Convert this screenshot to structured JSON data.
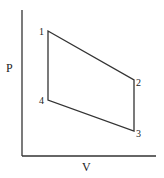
{
  "diagram": {
    "type": "pv-cycle",
    "axes": {
      "x_label": "V",
      "y_label": "P"
    },
    "points": [
      {
        "label": "1",
        "x": 48,
        "y": 31
      },
      {
        "label": "2",
        "x": 134,
        "y": 80
      },
      {
        "label": "3",
        "x": 134,
        "y": 131
      },
      {
        "label": "4",
        "x": 48,
        "y": 100
      }
    ],
    "colors": {
      "line": "#333333",
      "background": "#ffffff"
    }
  }
}
